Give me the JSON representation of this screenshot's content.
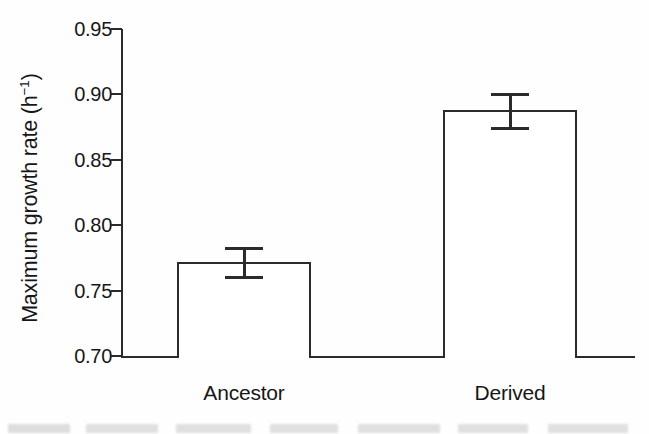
{
  "chart_data": {
    "type": "bar",
    "title": "",
    "subtitle": "",
    "xlabel": "",
    "ylabel": "Maximum growth rate (h⁻¹)",
    "ylabel_text": "Maximum growth rate (h",
    "ylabel_sup": "−1",
    "ylabel_tail": ")",
    "categories": [
      "Ancestor",
      "Derived"
    ],
    "values": [
      0.772,
      0.888
    ],
    "errors": [
      0.011,
      0.013
    ],
    "error_type": "symmetric",
    "ylim": [
      0.7,
      0.95
    ],
    "yticks": [
      0.95,
      0.9,
      0.85,
      0.8,
      0.75,
      0.7
    ],
    "ytick_labels": [
      "0.95",
      "0.90",
      "0.85",
      "0.80",
      "0.75",
      "0.70"
    ],
    "grid": false,
    "legend": false,
    "legend_position": "none",
    "bar_fill_color": "#ffffff",
    "bar_edge_color": "#2b2b2b",
    "axis_color": "#2b2b2b",
    "background_color": "#fefefe",
    "series": [
      {
        "name": "Maximum growth rate",
        "values": [
          0.772,
          0.888
        ],
        "errors": [
          0.011,
          0.013
        ]
      }
    ],
    "error_bar_detail": [
      {
        "category": "Ancestor",
        "value": 0.772,
        "upper": 0.783,
        "lower": 0.761
      },
      {
        "category": "Derived",
        "value": 0.888,
        "upper": 0.901,
        "lower": 0.875
      }
    ]
  }
}
